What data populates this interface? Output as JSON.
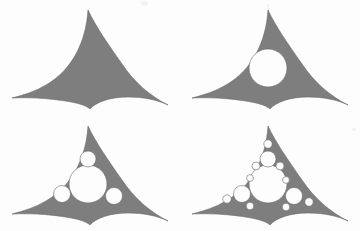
{
  "figure": {
    "background_color": "#fdfdfd",
    "fill_color": "#7e7e7e",
    "edge_color": "#6a6a6a",
    "hole_color": "#fdfdfd",
    "panel_width": 180,
    "panel_height": 116,
    "columns": 2,
    "rows": 2
  },
  "shape": {
    "name": "curvilinear-triangle",
    "apex": {
      "x": 88,
      "y": 10
    },
    "left_tip": {
      "x": 12,
      "y": 98
    },
    "right_tip": {
      "x": 168,
      "y": 105
    },
    "outline_path": "M 88 10 C 86 42 72 70 46 85 C 36 91 24 95 12 98 C 34 97 58 99 76 103 C 84 105 88 107 90 109 C 96 102 110 97 128 97 C 144 97 158 100 168 105 C 150 96 134 82 122 64 C 108 44 96 27 88 10 Z"
  },
  "panels": [
    {
      "id": "panel-1",
      "label": "stage-1",
      "generation": 0,
      "circle_count": 0,
      "circles": []
    },
    {
      "id": "panel-2",
      "label": "stage-2",
      "generation": 1,
      "circle_count": 1,
      "circles": [
        {
          "cx": 88,
          "cy": 68,
          "r": 19,
          "generation": 1
        }
      ]
    },
    {
      "id": "panel-3",
      "label": "stage-3",
      "generation": 2,
      "circle_count": 4,
      "circles": [
        {
          "cx": 88,
          "cy": 68,
          "r": 19,
          "generation": 1
        },
        {
          "cx": 88,
          "cy": 43,
          "r": 8,
          "generation": 2
        },
        {
          "cx": 62,
          "cy": 78,
          "r": 8.5,
          "generation": 2
        },
        {
          "cx": 114,
          "cy": 80,
          "r": 8.5,
          "generation": 2
        }
      ]
    },
    {
      "id": "panel-4",
      "label": "stage-4",
      "generation": 3,
      "circle_count": 13,
      "circles": [
        {
          "cx": 88,
          "cy": 68,
          "r": 19,
          "generation": 1
        },
        {
          "cx": 88,
          "cy": 43,
          "r": 8,
          "generation": 2
        },
        {
          "cx": 62,
          "cy": 78,
          "r": 8.5,
          "generation": 2
        },
        {
          "cx": 114,
          "cy": 80,
          "r": 8.5,
          "generation": 2
        },
        {
          "cx": 88,
          "cy": 28,
          "r": 4.2,
          "generation": 3
        },
        {
          "cx": 76,
          "cy": 50,
          "r": 4.0,
          "generation": 3
        },
        {
          "cx": 100,
          "cy": 50,
          "r": 4.0,
          "generation": 3
        },
        {
          "cx": 47,
          "cy": 83,
          "r": 4.2,
          "generation": 3
        },
        {
          "cx": 70,
          "cy": 90,
          "r": 3.8,
          "generation": 3
        },
        {
          "cx": 70,
          "cy": 62,
          "r": 3.4,
          "generation": 3
        },
        {
          "cx": 129,
          "cy": 86,
          "r": 4.2,
          "generation": 3
        },
        {
          "cx": 106,
          "cy": 91,
          "r": 3.8,
          "generation": 3
        },
        {
          "cx": 106,
          "cy": 64,
          "r": 3.4,
          "generation": 3
        }
      ]
    }
  ]
}
